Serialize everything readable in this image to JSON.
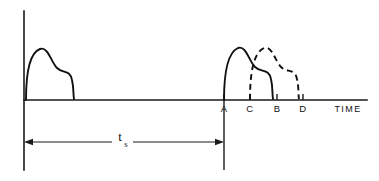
{
  "figure": {
    "background_color": "#ffffff",
    "line_color": "#111111"
  },
  "axes": {
    "x_axis_label": "TIME",
    "y_axis": {
      "name": "amplitude-axis",
      "x": 24,
      "top_y": 11,
      "bottom_y": 170
    },
    "x_axis": {
      "name": "time-axis",
      "y": 100,
      "left_x": 24,
      "right_x": 367
    },
    "ticks": [
      {
        "label": "A",
        "x": 224
      },
      {
        "label": "C",
        "x": 250
      },
      {
        "label": "B",
        "x": 277
      },
      {
        "label": "D",
        "x": 303
      }
    ]
  },
  "pulses": [
    {
      "name": "initial-pulse",
      "style": "solid",
      "start_x": 26,
      "end_x": 80,
      "peak_x": 40,
      "peak_y": 49,
      "shoulder_y": 70,
      "path": "M 26,100 C 26,72 30,52 40,49 C 48,47 51,62 56,68 C 62,74 70,70 72,80 C 74,88 73,92 74,99"
    },
    {
      "name": "pulse-a-b",
      "style": "solid",
      "start_label": "A",
      "end_label": "B",
      "start_x": 224,
      "end_x": 277,
      "peak_x": 239,
      "peak_y": 48,
      "path": "M 224,100 C 224,72 228,51 239,48 C 247,46 250,61 255,67 C 261,73 269,69 271,79 C 273,87 272,92 273,99"
    },
    {
      "name": "pulse-c-d",
      "style": "dashed",
      "start_label": "C",
      "end_label": "D",
      "start_x": 250,
      "end_x": 303,
      "peak_x": 265,
      "peak_y": 48,
      "dash_pattern": "6 4",
      "path": "M 250,100 C 250,72 254,51 265,48 C 273,46 276,61 281,67 C 287,73 295,69 297,79 C 299,87 298,92 299,99"
    }
  ],
  "dimension": {
    "name": "ts-interval",
    "symbol": "t",
    "subscript": "s",
    "from_x": 24,
    "to_x": 224,
    "y": 142,
    "label_x": 122,
    "description": "sampling interval between start of first pulse and point A"
  }
}
